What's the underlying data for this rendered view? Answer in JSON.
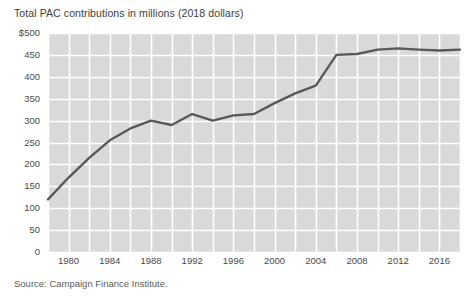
{
  "chart_data": {
    "type": "line",
    "title": "Total PAC contributions in millions (2018 dollars)",
    "xlabel": "",
    "ylabel": "",
    "source": "Source: Campaign Finance Institute.",
    "grid": true,
    "legend": "none",
    "xlim": [
      1978,
      2018
    ],
    "ylim": [
      0,
      500
    ],
    "y_ticks": [
      500,
      450,
      400,
      350,
      300,
      250,
      200,
      150,
      100,
      50,
      0
    ],
    "y_tick_labels": [
      "$500",
      "450",
      "400",
      "350",
      "300",
      "250",
      "200",
      "150",
      "100",
      "50",
      "0"
    ],
    "x_ticks": [
      1980,
      1984,
      1988,
      1992,
      1996,
      2000,
      2004,
      2008,
      2012,
      2016
    ],
    "x_tick_labels": [
      "1980",
      "1984",
      "1988",
      "1992",
      "1996",
      "2000",
      "2004",
      "2008",
      "2012",
      "2016"
    ],
    "x_gridlines": [
      1978,
      1980,
      1982,
      1984,
      1986,
      1988,
      1990,
      1992,
      1994,
      1996,
      1998,
      2000,
      2002,
      2004,
      2006,
      2008,
      2010,
      2012,
      2014,
      2016,
      2018
    ],
    "series": [
      {
        "name": "Total PAC contributions",
        "color": "#595959",
        "x": [
          1978,
          1980,
          1982,
          1984,
          1986,
          1988,
          1990,
          1992,
          1994,
          1996,
          1998,
          2000,
          2002,
          2004,
          2006,
          2008,
          2010,
          2012,
          2014,
          2016,
          2018
        ],
        "values": [
          120,
          170,
          215,
          255,
          282,
          300,
          290,
          315,
          300,
          312,
          315,
          340,
          362,
          380,
          450,
          452,
          462,
          465,
          462,
          460,
          462
        ]
      }
    ],
    "colors": {
      "plot_background": "#d9d9d9",
      "gridline": "#ffffff",
      "line": "#595959",
      "text": "#4a4a4a",
      "page_background": "#ffffff"
    }
  }
}
